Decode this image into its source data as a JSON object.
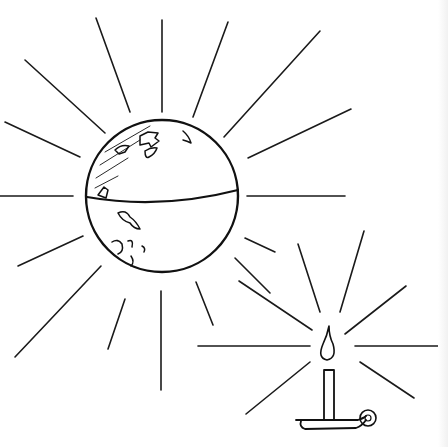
{
  "illustration": {
    "title": "Sun-globe and candle line drawing",
    "ink_color": "#111111",
    "background": "#ffffff",
    "globe": {
      "cx": 162,
      "cy": 196,
      "r": 76,
      "equator": "M87,197 Q160,210 238,190",
      "continents": [
        "M140,136 l8,-4 l10,1 l-3,5 l4,3 l-8,6 l-2,-4 l-9,2 z",
        "M145,151 q6,-4 12,-3 q-2,6 -8,9 q-4,2 -4,-6",
        "M115,150 q6,-6 14,-4 l-4,6 l-6,2 z",
        "M183,131 q6,5 8,12 q-4,-2 -8,-3",
        "M98,195 l6,-8 l4,3 l-2,8 z",
        "M118,213 q8,-4 12,4 q6,4 10,12 q-6,0 -10,-6 q-8,-2 -12,-10",
        "M112,242 q6,-4 10,2 q2,8 -4,10",
        "M128,241 q6,-2 4,6",
        "M142,246 q4,2 2,6",
        "M131,256 q4,6 0,10"
      ],
      "hatch": [
        "M105,152 L150,126",
        "M100,165 L140,140",
        "M96,178 L128,158",
        "M95,188 L118,176"
      ]
    },
    "sun_rays": [
      {
        "x1": 96,
        "y1": 18,
        "x2": 130,
        "y2": 112
      },
      {
        "x1": 162,
        "y1": 20,
        "x2": 162,
        "y2": 112
      },
      {
        "x1": 228,
        "y1": 22,
        "x2": 193,
        "y2": 117
      },
      {
        "x1": 320,
        "y1": 31,
        "x2": 224,
        "y2": 137
      },
      {
        "x1": 351,
        "y1": 109,
        "x2": 248,
        "y2": 158
      },
      {
        "x1": 247,
        "y1": 196,
        "x2": 345,
        "y2": 196
      },
      {
        "x1": 25,
        "y1": 60,
        "x2": 105,
        "y2": 133
      },
      {
        "x1": 5,
        "y1": 122,
        "x2": 80,
        "y2": 157
      },
      {
        "x1": 0,
        "y1": 196,
        "x2": 73,
        "y2": 196
      },
      {
        "x1": 18,
        "y1": 266,
        "x2": 83,
        "y2": 236
      },
      {
        "x1": 15,
        "y1": 357,
        "x2": 101,
        "y2": 266
      },
      {
        "x1": 108,
        "y1": 349,
        "x2": 125,
        "y2": 299
      },
      {
        "x1": 161,
        "y1": 291,
        "x2": 161,
        "y2": 390
      },
      {
        "x1": 196,
        "y1": 282,
        "x2": 213,
        "y2": 325
      },
      {
        "x1": 245,
        "y1": 238,
        "x2": 275,
        "y2": 252
      },
      {
        "x1": 235,
        "y1": 258,
        "x2": 270,
        "y2": 293
      }
    ],
    "candle_rays": [
      {
        "x1": 198,
        "y1": 346,
        "x2": 310,
        "y2": 346
      },
      {
        "x1": 355,
        "y1": 346,
        "x2": 445,
        "y2": 346
      },
      {
        "x1": 239,
        "y1": 281,
        "x2": 312,
        "y2": 330
      },
      {
        "x1": 298,
        "y1": 244,
        "x2": 320,
        "y2": 312
      },
      {
        "x1": 364,
        "y1": 231,
        "x2": 340,
        "y2": 312
      },
      {
        "x1": 406,
        "y1": 286,
        "x2": 345,
        "y2": 334
      },
      {
        "x1": 360,
        "y1": 362,
        "x2": 414,
        "y2": 398
      },
      {
        "x1": 310,
        "y1": 362,
        "x2": 246,
        "y2": 414
      }
    ],
    "candle": {
      "flame": "M329,326 q-2,10 -6,18 q-6,14 4,16 q10,-2 6,-16 q-4,-8 -4,-18 z",
      "stick": "M324,370 L324,420 M334,370 L334,420 M324,370 L334,370",
      "holder": "M296,420 L358,420 Q364,418 366,416 M301,421 q-2,6 4,8 L356,428 q6,-2 10,-8",
      "handle_cx": 368,
      "handle_cy": 418,
      "handle_r": 8,
      "handle_inner_r": 3
    }
  }
}
